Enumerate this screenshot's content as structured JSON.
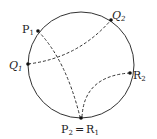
{
  "diagram": {
    "type": "poincare-disk",
    "colors": {
      "stroke": "#333333",
      "background": "#ffffff"
    },
    "circle": {
      "cx": 81,
      "cy": 65,
      "r": 53
    },
    "points": [
      {
        "id": "P1",
        "base": "P",
        "sub": "1",
        "x": 38,
        "y": 31
      },
      {
        "id": "Q2",
        "base": "Q",
        "sub": "2",
        "x": 111,
        "y": 20
      },
      {
        "id": "Q1",
        "base": "Q",
        "sub": "1",
        "x": 28,
        "y": 64
      },
      {
        "id": "R2",
        "base": "R",
        "sub": "2",
        "x": 130,
        "y": 73
      },
      {
        "id": "P2R1",
        "base": "P",
        "sub": "2",
        "x": 81,
        "y": 118
      }
    ],
    "labels": {
      "P1": {
        "base": "P",
        "sub": "1"
      },
      "Q2": {
        "base": "Q",
        "sub": "2"
      },
      "Q1": {
        "base": "Q",
        "sub": "1"
      },
      "R2": {
        "base": "R",
        "sub": "2"
      },
      "bottom": {
        "p": "P",
        "p_sub": "2",
        "eq": "=",
        "r": "R",
        "r_sub": "1"
      }
    },
    "geodesics": [
      {
        "from": "P1",
        "to": "P2R1",
        "style": "dashed"
      },
      {
        "from": "Q1",
        "to": "Q2",
        "style": "dashed"
      },
      {
        "from": "P2R1",
        "to": "R2",
        "style": "dashed"
      }
    ]
  }
}
